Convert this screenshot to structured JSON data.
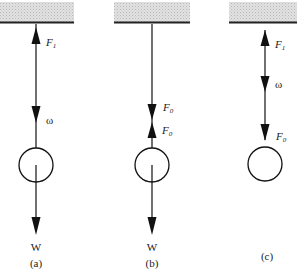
{
  "diagram": {
    "colors": {
      "ceiling_fill": "#d4d4d4",
      "ceiling_edge": "#222222",
      "stroke": "#111111",
      "background": "#ffffff"
    },
    "panels": [
      {
        "id": "a",
        "caption": "(a)",
        "force_top": {
          "symbol": "F",
          "subscript": "1"
        },
        "omega_label": "ω",
        "weight_label": "W"
      },
      {
        "id": "b",
        "caption": "(b)",
        "force_upper": {
          "symbol": "F",
          "subscript": "0"
        },
        "force_lower": {
          "symbol": "F",
          "subscript": "0"
        },
        "weight_label": "W"
      },
      {
        "id": "c",
        "caption": "(c)",
        "force_top": {
          "symbol": "F",
          "subscript": "1"
        },
        "omega_label": "ω",
        "force_bottom": {
          "symbol": "F",
          "subscript": "0"
        }
      }
    ]
  }
}
